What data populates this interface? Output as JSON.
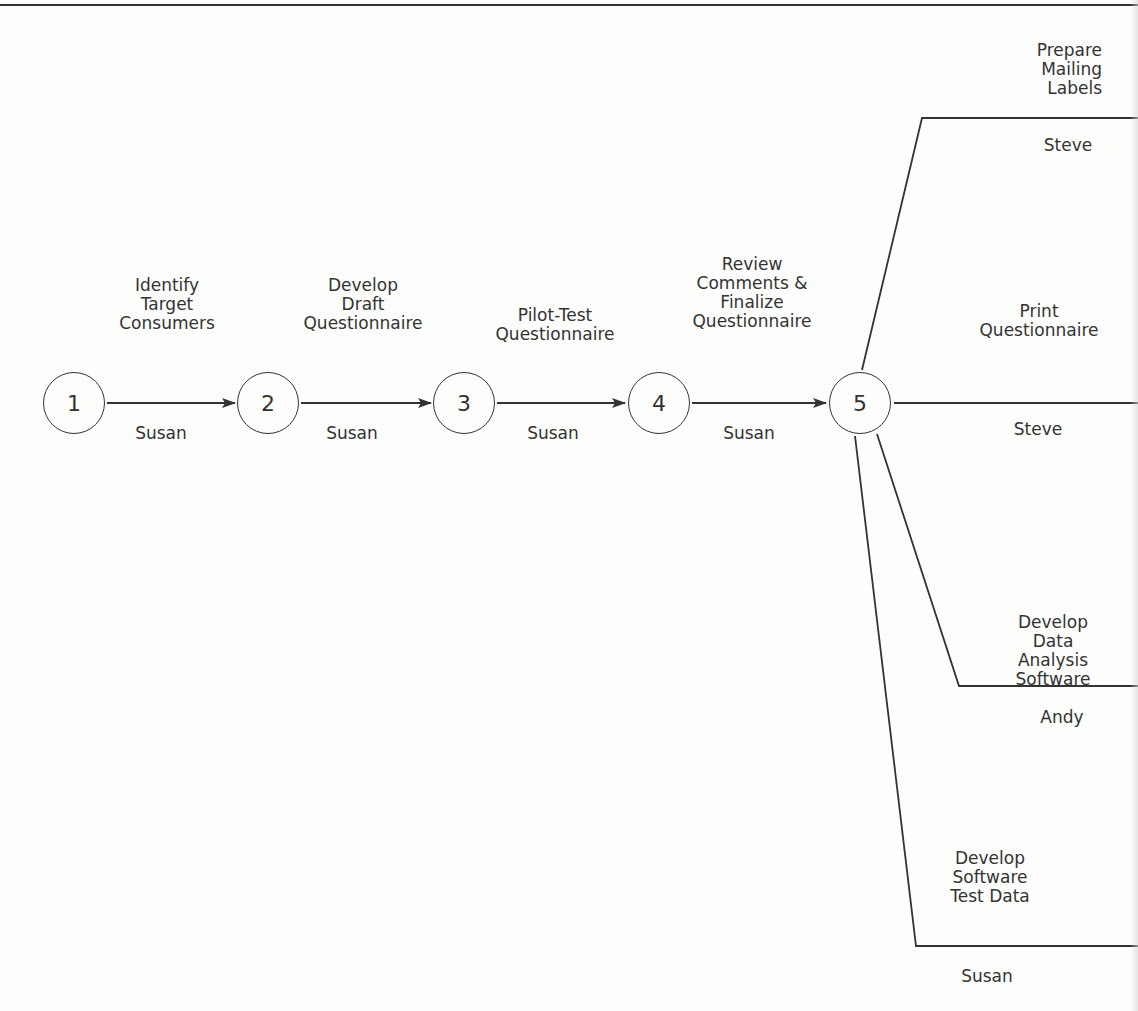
{
  "figure": {
    "title_clipped": "",
    "nodes": [
      {
        "id": "1",
        "label": "1"
      },
      {
        "id": "2",
        "label": "2"
      },
      {
        "id": "3",
        "label": "3"
      },
      {
        "id": "4",
        "label": "4"
      },
      {
        "id": "5",
        "label": "5"
      }
    ],
    "activities": [
      {
        "from": "1",
        "to": "2",
        "task": "Identify\nTarget\nConsumers",
        "owner": "Susan"
      },
      {
        "from": "2",
        "to": "3",
        "task": "Develop\nDraft\nQuestionnaire",
        "owner": "Susan"
      },
      {
        "from": "3",
        "to": "4",
        "task": "Pilot-Test\nQuestionnaire",
        "owner": "Susan"
      },
      {
        "from": "4",
        "to": "5",
        "task": "Review\nComments &\nFinalize\nQuestionnaire",
        "owner": "Susan"
      },
      {
        "from": "5",
        "to": "",
        "task": "Prepare\nMailing Labels",
        "owner": "Steve"
      },
      {
        "from": "5",
        "to": "",
        "task": "Print\nQuestionnaire",
        "owner": "Steve"
      },
      {
        "from": "5",
        "to": "",
        "task": "Develop Data\nAnalysis Software",
        "owner": "Andy"
      },
      {
        "from": "5",
        "to": "",
        "task": "Develop\nSoftware\nTest Data",
        "owner": "Susan"
      }
    ]
  }
}
